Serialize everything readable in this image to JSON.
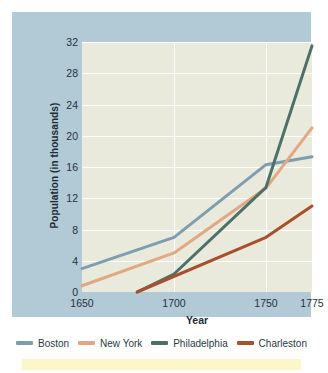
{
  "chart_data": {
    "type": "line",
    "title": "",
    "xlabel": "Year",
    "ylabel": "Population (in thousands)",
    "xlim": [
      1650,
      1775
    ],
    "ylim": [
      0,
      32
    ],
    "xticks": [
      1650,
      1700,
      1750,
      1775
    ],
    "yticks": [
      0,
      4,
      8,
      12,
      16,
      20,
      24,
      28,
      32
    ],
    "grid": true,
    "legend_position": "bottom",
    "series": [
      {
        "name": "Boston",
        "color": "#7e9eb0",
        "x": [
          1650,
          1700,
          1750,
          1775
        ],
        "values": [
          3.0,
          7.0,
          16.3,
          17.3
        ]
      },
      {
        "name": "New York",
        "color": "#e2a882",
        "x": [
          1650,
          1700,
          1750,
          1775
        ],
        "values": [
          0.8,
          5.0,
          13.3,
          21.0
        ]
      },
      {
        "name": "Philadelphia",
        "color": "#4d7168",
        "x": [
          1680,
          1700,
          1750,
          1775
        ],
        "values": [
          0.0,
          2.3,
          13.4,
          31.5
        ]
      },
      {
        "name": "Charleston",
        "color": "#a8502c",
        "x": [
          1680,
          1750,
          1775
        ],
        "values": [
          0.0,
          7.0,
          11.0
        ]
      }
    ]
  },
  "axes": {
    "y_labels": [
      "32",
      "28",
      "24",
      "20",
      "16",
      "12",
      "8",
      "4",
      "0"
    ],
    "x_labels": [
      "1650",
      "1700",
      "1750",
      "1775"
    ],
    "y_title": "Population (in thousands)",
    "x_title": "Year"
  },
  "legend": {
    "items": [
      {
        "label": "Boston",
        "color": "#7e9eb0"
      },
      {
        "label": "New York",
        "color": "#e2a882"
      },
      {
        "label": "Philadelphia",
        "color": "#4d7168"
      },
      {
        "label": "Charleston",
        "color": "#a8502c"
      }
    ]
  },
  "colors": {
    "panel_background": "#b2c9d6",
    "plot_background": "#e9e9dc",
    "gridline": "#ffffff",
    "text": "#24333c",
    "accent_band": "#fbf7c9"
  }
}
